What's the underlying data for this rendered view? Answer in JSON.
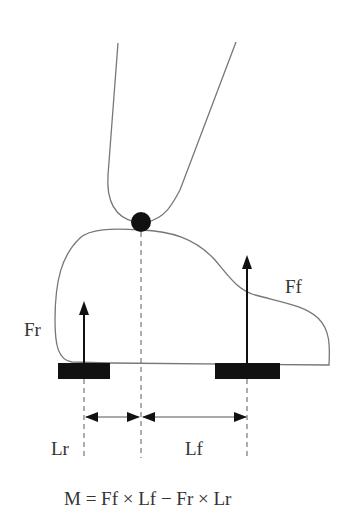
{
  "diagram": {
    "type": "free-body diagram of vehicle pitch moment",
    "labels": {
      "rear_force": "Fr",
      "front_force": "Ff",
      "rear_length": "Lr",
      "front_length": "Lf"
    },
    "equation": "M = Ff × Lf − Fr × Lr",
    "colors": {
      "line": "#666666",
      "fill": "#111111",
      "text": "#333333"
    }
  }
}
